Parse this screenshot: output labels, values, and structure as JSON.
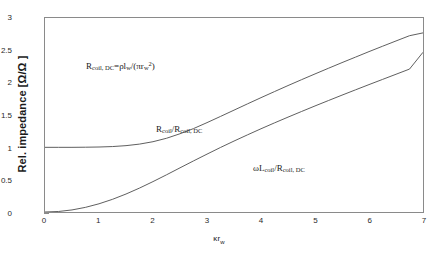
{
  "chart_data": {
    "type": "line",
    "title": "",
    "subtitle": "",
    "xlabel": "κr_w",
    "ylabel": "Rel. impedance [Ω/Ω]",
    "xlim": [
      0,
      7
    ],
    "ylim": [
      0,
      3
    ],
    "xticks": [
      "0",
      "1",
      "2",
      "3",
      "4",
      "5",
      "6",
      "7"
    ],
    "yticks": [
      "0",
      "0.5",
      "1",
      "1.5",
      "2",
      "2.5",
      "3"
    ],
    "grid": false,
    "legend_position": "inline-annotations",
    "x": [
      0,
      0.25,
      0.5,
      0.75,
      1,
      1.25,
      1.5,
      1.75,
      2,
      2.25,
      2.5,
      2.75,
      3,
      3.25,
      3.5,
      3.75,
      4,
      4.25,
      4.5,
      4.75,
      5,
      5.25,
      5.5,
      5.75,
      6,
      6.25,
      6.5,
      6.75,
      7
    ],
    "series": [
      {
        "name": "R_coil/R_coil,DC",
        "values": [
          1.0,
          1.0,
          1.0,
          1.002,
          1.005,
          1.012,
          1.026,
          1.05,
          1.087,
          1.14,
          1.21,
          1.29,
          1.382,
          1.478,
          1.575,
          1.672,
          1.768,
          1.862,
          1.955,
          2.046,
          2.135,
          2.223,
          2.31,
          2.395,
          2.48,
          2.563,
          2.645,
          2.726,
          2.77
        ]
      },
      {
        "name": "ωL_coil/R_coil,DC",
        "values": [
          0.0,
          0.008,
          0.032,
          0.072,
          0.127,
          0.196,
          0.278,
          0.37,
          0.47,
          0.575,
          0.683,
          0.79,
          0.895,
          0.998,
          1.097,
          1.193,
          1.287,
          1.378,
          1.467,
          1.554,
          1.64,
          1.724,
          1.807,
          1.889,
          1.97,
          2.05,
          2.13,
          2.21,
          2.47
        ]
      }
    ],
    "annotations": [
      {
        "id": "dc-resistance-formula",
        "text": "R_coil,DC = ρl_w/(πr_w²)",
        "x_data": 0.75,
        "y_data": 2.52
      },
      {
        "id": "resistance-curve-label",
        "text": "R_coil/R_coil,DC",
        "x_data": 2.3,
        "y_data": 1.78
      },
      {
        "id": "reactance-curve-label",
        "text": "ωL_coil/R_coil,DC",
        "x_data": 4.35,
        "y_data": 1.17
      }
    ],
    "line_color": "#4d4d4d",
    "axis_color": "#8a8a8a",
    "background_color": "#ffffff"
  },
  "annotation_text": {
    "dc_formula": {
      "r": "R",
      "r_sub": "coil, DC",
      "eq": "=",
      "rho_l": "ρl",
      "l_sub": "w",
      "slash_open": "/(",
      "pi_r": "πr",
      "r_sub2": "w",
      "sup2": "2",
      "close": ")"
    },
    "resistance_label": {
      "r1": "R",
      "r1_sub": "coil",
      "slash": "/",
      "r2": "R",
      "r2_sub": "coil, DC"
    },
    "reactance_label": {
      "omega_l": "ωL",
      "l_sub": "coil",
      "slash": "/",
      "r": "R",
      "r_sub": "coil, DC"
    }
  },
  "axes": {
    "ylabel_text": "Rel. impedance [Ω/Ω ]",
    "xlabel_main": "κr",
    "xlabel_sub": "w"
  }
}
